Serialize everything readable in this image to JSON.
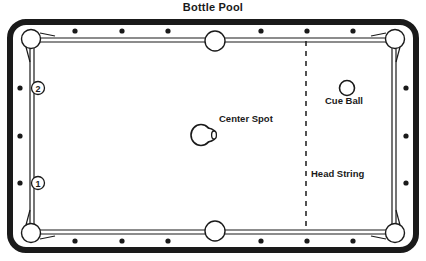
{
  "diagram": {
    "title": "Bottle Pool",
    "type": "billiard-table-layout",
    "table": {
      "cushion_color": "#1a1a1a",
      "cloth_color": "#ffffff",
      "rail_diamonds": {
        "top_count": 6,
        "bottom_count": 6,
        "left_count": 3,
        "right_count": 3,
        "color": "#1a1a1a"
      },
      "pockets": {
        "count": 6,
        "names": [
          "top-left",
          "top-center",
          "top-right",
          "bottom-left",
          "bottom-center",
          "bottom-right"
        ]
      }
    },
    "labels": {
      "center_spot": "Center Spot",
      "cue_ball": "Cue Ball",
      "head_string": "Head String"
    },
    "markers": [
      {
        "id": "1",
        "label": "1",
        "position": "left-rail-lower"
      },
      {
        "id": "2",
        "label": "2",
        "position": "left-rail-upper"
      }
    ],
    "objects": {
      "bottle": {
        "name": "bottle",
        "at": "center-spot"
      },
      "cue_ball": {
        "name": "cue-ball",
        "at": "head-area"
      },
      "head_string": {
        "name": "head-string",
        "style": "dashed-vertical"
      }
    }
  }
}
